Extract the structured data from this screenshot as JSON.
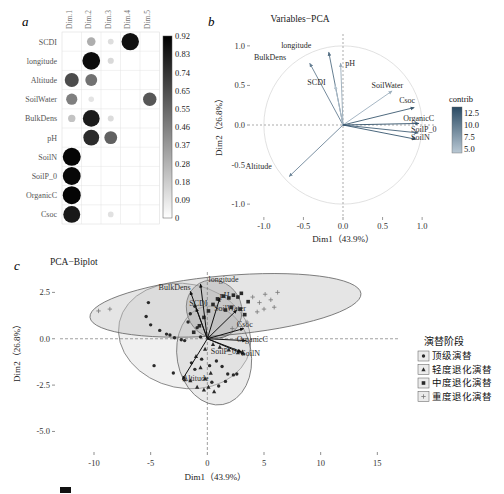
{
  "figure": {
    "panels": [
      "a",
      "b",
      "c"
    ],
    "caption_partial": ""
  },
  "panel_a": {
    "letter": "a",
    "columns": [
      "Dim.1",
      "Dim.2",
      "Dim.3",
      "Dim.4",
      "Dim.5"
    ],
    "rows": [
      "SCDI",
      "longitude",
      "Altitude",
      "SoilWater",
      "BulkDens",
      "pH",
      "SoilN",
      "SoilP_0",
      "OrganicC",
      "Csoc"
    ],
    "colorbar": {
      "ticks": [
        "0.92",
        "0.83",
        "0.74",
        "0.65",
        "0.55",
        "0.46",
        "0.37",
        "0.28",
        "0.18",
        "0.09",
        "0"
      ],
      "max": 0.92,
      "min": 0,
      "low_color": "#ffffff",
      "high_color": "#000000"
    },
    "matrix": [
      [
        0.0,
        0.3,
        0.12,
        0.88,
        0.0
      ],
      [
        0.0,
        0.9,
        0.14,
        0.0,
        0.0
      ],
      [
        0.66,
        0.52,
        0.0,
        0.0,
        0.0
      ],
      [
        0.47,
        0.1,
        0.0,
        0.0,
        0.62
      ],
      [
        0.22,
        0.84,
        0.13,
        0.0,
        0.0
      ],
      [
        0.0,
        0.78,
        0.58,
        0.0,
        0.0
      ],
      [
        0.92,
        0.0,
        0.0,
        0.0,
        0.0
      ],
      [
        0.91,
        0.0,
        0.0,
        0.0,
        0.0
      ],
      [
        0.92,
        0.0,
        0.0,
        0.0,
        0.0
      ],
      [
        0.85,
        0.0,
        0.11,
        0.0,
        0.0
      ]
    ]
  },
  "panel_b": {
    "letter": "b",
    "title": "Variables−PCA",
    "xlabel": "Dim1（43.9%）",
    "ylabel": "Dim2（26.8%）",
    "xticks": [
      "-1.0",
      "-0.5",
      "0.0",
      "0.5",
      "1.0"
    ],
    "yticks": [
      "-1.0",
      "-0.5",
      "0.0",
      "0.5",
      "1.0"
    ],
    "xlim": [
      -1.15,
      1.15
    ],
    "ylim": [
      -1.15,
      1.15
    ],
    "contrib": {
      "label": "contrib",
      "ticks": [
        "12.5",
        "10.0",
        "7.5",
        "5.0"
      ],
      "low_color": "#b9c8d4",
      "high_color": "#2a4a63"
    },
    "vectors": [
      {
        "name": "longitude",
        "x": -0.18,
        "y": 0.92,
        "contrib": 10.5,
        "lx": -0.4,
        "ly": 0.97
      },
      {
        "name": "BulkDens",
        "x": -0.42,
        "y": 0.78,
        "contrib": 9.5,
        "lx": -0.72,
        "ly": 0.82
      },
      {
        "name": "SCDI",
        "x": -0.1,
        "y": 0.5,
        "contrib": 5.0,
        "lx": -0.22,
        "ly": 0.5
      },
      {
        "name": "pH",
        "x": -0.03,
        "y": 0.78,
        "contrib": 6.5,
        "lx": 0.03,
        "ly": 0.74
      },
      {
        "name": "SoilWater",
        "x": 0.62,
        "y": 0.43,
        "contrib": 6.2,
        "lx": 0.36,
        "ly": 0.47
      },
      {
        "name": "Csoc",
        "x": 0.9,
        "y": 0.22,
        "contrib": 12.0,
        "lx": 0.71,
        "ly": 0.28
      },
      {
        "name": "OrganicC",
        "x": 0.96,
        "y": 0.02,
        "contrib": 12.5,
        "lx": 0.76,
        "ly": 0.05
      },
      {
        "name": "SoilP_0",
        "x": 0.95,
        "y": -0.1,
        "contrib": 11.5,
        "lx": 0.86,
        "ly": -0.09
      },
      {
        "name": "SoilN",
        "x": 0.92,
        "y": -0.18,
        "contrib": 12.2,
        "lx": 0.86,
        "ly": -0.19
      },
      {
        "name": "Altitude",
        "x": -0.68,
        "y": -0.65,
        "contrib": 9.0,
        "lx": -0.9,
        "ly": -0.56
      }
    ]
  },
  "panel_c": {
    "letter": "c",
    "title": "PCA−Biplot",
    "xlabel": "Dim1（43.9%）",
    "ylabel": "Dim2（26.8%）",
    "xticks": [
      "-10",
      "-5",
      "0",
      "5",
      "10",
      "15"
    ],
    "yticks": [
      "2.5",
      "0.0",
      "-2.5",
      "-5.0"
    ],
    "xlim": [
      -13,
      17
    ],
    "ylim": [
      -6.0,
      3.6
    ],
    "legend": {
      "title": "演替阶段",
      "items": [
        {
          "label": "顶级演替",
          "marker": "circle"
        },
        {
          "label": "轻度退化演替",
          "marker": "triangle"
        },
        {
          "label": "中度退化演替",
          "marker": "square"
        },
        {
          "label": "重度退化演替",
          "marker": "plus"
        }
      ]
    },
    "vectors": [
      {
        "name": "longitude",
        "x": -0.6,
        "y": 2.95,
        "lx": 0.1,
        "ly": 3.05
      },
      {
        "name": "BulkDens",
        "x": -1.5,
        "y": 2.55,
        "lx": -4.3,
        "ly": 2.62
      },
      {
        "name": "SCDI",
        "x": -1.0,
        "y": 1.65,
        "lx": -1.6,
        "ly": 1.75
      },
      {
        "name": "pH",
        "x": 1.1,
        "y": 2.2,
        "lx": 1.1,
        "ly": 2.2
      },
      {
        "name": "SoilWater",
        "x": 2.6,
        "y": 1.55,
        "lx": 0.6,
        "ly": 1.5
      },
      {
        "name": "Csoc",
        "x": 3.2,
        "y": 0.55,
        "lx": 2.6,
        "ly": 0.62
      },
      {
        "name": "OrganicC",
        "x": 3.4,
        "y": -0.1,
        "lx": 2.6,
        "ly": -0.15
      },
      {
        "name": "SoilP_0",
        "x": 3.0,
        "y": -0.7,
        "lx": 0.3,
        "ly": -0.8
      },
      {
        "name": "SoilN",
        "x": 3.3,
        "y": -0.85,
        "lx": 3.0,
        "ly": -0.95
      },
      {
        "name": "Altitude",
        "x": -2.2,
        "y": -2.2,
        "lx": -2.2,
        "ly": -2.3
      }
    ],
    "clusters": [
      {
        "name": "顶级演替",
        "marker": "circle",
        "cx": -2.0,
        "cy": 0.15,
        "rx": 4.6,
        "ry": 3.6,
        "rot": 78,
        "fill": "#dcdcdc",
        "stroke": "#7a7a7a"
      },
      {
        "name": "轻度退化演替",
        "marker": "triangle",
        "cx": 0.6,
        "cy": -0.9,
        "rx": 4.4,
        "ry": 2.0,
        "rot": 100,
        "fill": "#d0d0d0",
        "stroke": "#6e6e6e"
      },
      {
        "name": "中度退化演替",
        "marker": "square",
        "cx": 0.6,
        "cy": 1.6,
        "rx": 2.4,
        "ry": 1.6,
        "rot": 30,
        "fill": "#9a9a9a",
        "stroke": "#4a4a4a"
      },
      {
        "name": "重度退化演替",
        "marker": "plus",
        "cx": 1.6,
        "cy": 1.8,
        "rx": 12.0,
        "ry": 1.6,
        "rot": 5,
        "fill": "#c2c2c2",
        "stroke": "#646464"
      }
    ],
    "points": [
      {
        "x": -5.2,
        "y": 1.95,
        "m": "circle"
      },
      {
        "x": -5.4,
        "y": 1.2,
        "m": "circle"
      },
      {
        "x": -5.0,
        "y": 0.75,
        "m": "circle"
      },
      {
        "x": -4.2,
        "y": 0.45,
        "m": "circle"
      },
      {
        "x": -3.6,
        "y": 0.25,
        "m": "circle"
      },
      {
        "x": -3.3,
        "y": 0.2,
        "m": "circle"
      },
      {
        "x": -2.9,
        "y": 0.05,
        "m": "circle"
      },
      {
        "x": -2.3,
        "y": -0.05,
        "m": "circle"
      },
      {
        "x": -2.0,
        "y": -0.1,
        "m": "circle"
      },
      {
        "x": -1.7,
        "y": 0.9,
        "m": "circle"
      },
      {
        "x": -1.5,
        "y": 1.35,
        "m": "circle"
      },
      {
        "x": -1.1,
        "y": 1.75,
        "m": "circle"
      },
      {
        "x": -0.9,
        "y": 0.6,
        "m": "circle"
      },
      {
        "x": -0.6,
        "y": 0.1,
        "m": "circle"
      },
      {
        "x": -4.7,
        "y": -1.45,
        "m": "circle"
      },
      {
        "x": -3.0,
        "y": -1.85,
        "m": "circle"
      },
      {
        "x": -1.4,
        "y": -1.3,
        "m": "circle"
      },
      {
        "x": -1.1,
        "y": -1.65,
        "m": "circle"
      },
      {
        "x": -0.5,
        "y": -1.1,
        "m": "circle"
      },
      {
        "x": 0.2,
        "y": -1.45,
        "m": "circle"
      },
      {
        "x": 0.8,
        "y": -1.2,
        "m": "circle"
      },
      {
        "x": 1.3,
        "y": -1.5,
        "m": "circle"
      },
      {
        "x": 1.8,
        "y": -1.9,
        "m": "circle"
      },
      {
        "x": 2.3,
        "y": -1.95,
        "m": "circle"
      },
      {
        "x": 2.6,
        "y": -1.9,
        "m": "circle"
      },
      {
        "x": 0.4,
        "y": -2.35,
        "m": "circle"
      },
      {
        "x": 1.0,
        "y": -2.55,
        "m": "circle"
      },
      {
        "x": 1.6,
        "y": -2.3,
        "m": "circle"
      },
      {
        "x": -0.3,
        "y": -2.75,
        "m": "triangle"
      },
      {
        "x": 0.1,
        "y": -2.6,
        "m": "triangle"
      },
      {
        "x": 0.6,
        "y": -2.85,
        "m": "triangle"
      },
      {
        "x": -0.9,
        "y": -2.6,
        "m": "triangle"
      },
      {
        "x": -1.5,
        "y": -2.25,
        "m": "triangle"
      },
      {
        "x": -2.0,
        "y": -2.2,
        "m": "triangle"
      },
      {
        "x": -0.2,
        "y": -2.15,
        "m": "triangle"
      },
      {
        "x": 0.3,
        "y": -1.85,
        "m": "triangle"
      },
      {
        "x": -0.6,
        "y": -1.55,
        "m": "triangle"
      },
      {
        "x": -1.0,
        "y": -0.95,
        "m": "triangle"
      },
      {
        "x": -0.2,
        "y": -0.55,
        "m": "triangle"
      },
      {
        "x": 0.5,
        "y": -0.3,
        "m": "triangle"
      },
      {
        "x": 1.1,
        "y": -0.45,
        "m": "triangle"
      },
      {
        "x": 1.9,
        "y": -0.6,
        "m": "triangle"
      },
      {
        "x": 2.7,
        "y": -0.75,
        "m": "triangle"
      },
      {
        "x": 3.1,
        "y": -0.7,
        "m": "triangle"
      },
      {
        "x": -1.2,
        "y": 0.35,
        "m": "square"
      },
      {
        "x": -0.7,
        "y": 0.7,
        "m": "square"
      },
      {
        "x": -0.3,
        "y": 1.15,
        "m": "square"
      },
      {
        "x": 0.1,
        "y": 1.5,
        "m": "square"
      },
      {
        "x": 0.5,
        "y": 1.85,
        "m": "square"
      },
      {
        "x": 0.9,
        "y": 2.15,
        "m": "square"
      },
      {
        "x": 1.4,
        "y": 2.3,
        "m": "square"
      },
      {
        "x": 1.9,
        "y": 2.2,
        "m": "square"
      },
      {
        "x": 2.3,
        "y": 2.35,
        "m": "square"
      },
      {
        "x": 2.7,
        "y": 2.25,
        "m": "square"
      },
      {
        "x": 1.6,
        "y": 1.55,
        "m": "square"
      },
      {
        "x": 2.1,
        "y": 1.7,
        "m": "square"
      },
      {
        "x": 2.9,
        "y": 1.6,
        "m": "square"
      },
      {
        "x": 3.3,
        "y": 1.3,
        "m": "square"
      },
      {
        "x": 3.0,
        "y": 2.45,
        "m": "square"
      },
      {
        "x": 3.6,
        "y": 2.0,
        "m": "square"
      },
      {
        "x": 4.0,
        "y": 2.25,
        "m": "plus"
      },
      {
        "x": 4.6,
        "y": 1.95,
        "m": "plus"
      },
      {
        "x": 5.1,
        "y": 2.4,
        "m": "plus"
      },
      {
        "x": 5.6,
        "y": 2.1,
        "m": "plus"
      },
      {
        "x": 6.2,
        "y": 2.5,
        "m": "plus"
      },
      {
        "x": 4.4,
        "y": 1.45,
        "m": "plus"
      },
      {
        "x": 5.0,
        "y": 1.6,
        "m": "plus"
      },
      {
        "x": 5.9,
        "y": 1.7,
        "m": "plus"
      },
      {
        "x": 3.5,
        "y": 0.9,
        "m": "plus"
      },
      {
        "x": -9.6,
        "y": 1.5,
        "m": "plus"
      },
      {
        "x": -8.6,
        "y": 1.6,
        "m": "plus"
      },
      {
        "x": 2.2,
        "y": 0.55,
        "m": "plus"
      }
    ]
  }
}
